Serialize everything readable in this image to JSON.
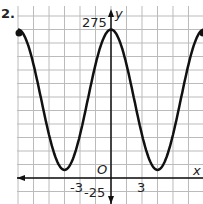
{
  "problem_number": "2.",
  "chart_data": {
    "type": "line",
    "title": "",
    "xlabel": "x",
    "ylabel": "y",
    "origin_label": "O",
    "x_tick_labels": [
      "-3",
      "3"
    ],
    "y_tick_labels": [
      "275",
      "-25"
    ],
    "xlim": [
      -9,
      9
    ],
    "ylim": [
      -25,
      275
    ],
    "grid": true,
    "x_grid_step": 1.5,
    "y_grid_step": 25,
    "function": "y = 130*cos(2*pi*x/9) + 145",
    "x": [
      -9,
      -6.75,
      -4.5,
      -2.25,
      0,
      2.25,
      4.5,
      6.75,
      9
    ],
    "y": [
      275,
      145,
      15,
      145,
      275,
      145,
      15,
      145,
      275
    ],
    "endpoints": [
      [
        -9,
        275
      ],
      [
        9,
        275
      ]
    ],
    "maximum": 275,
    "minimum": 15,
    "period": 9
  }
}
